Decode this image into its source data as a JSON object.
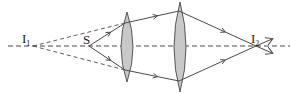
{
  "diagram": {
    "type": "ray-optics",
    "colors": {
      "stroke": "#4a4a4a",
      "lens_fill": "#c8c8c8",
      "background": "#ffffff"
    },
    "axis": {
      "y": 46,
      "x_start": 8,
      "x_end": 290,
      "style": "dashed"
    },
    "points": [
      {
        "id": "I1",
        "label": "I",
        "subscript": "1",
        "x": 33,
        "y": 46,
        "label_x": 22,
        "label_y": 43,
        "kind": "virtual-image"
      },
      {
        "id": "S",
        "label": "S",
        "subscript": "",
        "x": 89,
        "y": 46,
        "label_x": 83,
        "label_y": 44,
        "kind": "source"
      },
      {
        "id": "I2",
        "label": "I",
        "subscript": "2",
        "x": 256,
        "y": 46,
        "label_x": 251,
        "label_y": 43,
        "kind": "real-image"
      }
    ],
    "lenses": [
      {
        "id": "lens-1",
        "cx": 127,
        "top": 12,
        "bottom": 82,
        "half_width": 6
      },
      {
        "id": "lens-2",
        "cx": 180,
        "top": 2,
        "bottom": 92,
        "half_width": 6
      }
    ],
    "rays": [
      {
        "id": "ray-upper",
        "points": [
          [
            89,
            46
          ],
          [
            125,
            23
          ],
          [
            179,
            11
          ],
          [
            256,
            46
          ],
          [
            272,
            53
          ]
        ]
      },
      {
        "id": "ray-lower",
        "points": [
          [
            89,
            46
          ],
          [
            125,
            70
          ],
          [
            179,
            81
          ],
          [
            256,
            46
          ],
          [
            272,
            39
          ]
        ]
      }
    ],
    "virtual_rays": [
      {
        "id": "virtual-upper",
        "from": [
          33,
          46
        ],
        "to": [
          125,
          23
        ]
      },
      {
        "id": "virtual-lower",
        "from": [
          33,
          46
        ],
        "to": [
          125,
          70
        ]
      }
    ]
  }
}
